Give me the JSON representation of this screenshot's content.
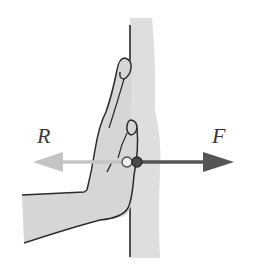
{
  "figure": {
    "labels": {
      "reaction": "R",
      "force": "F"
    },
    "colors": {
      "wall_fill": "#dcdcdc",
      "hand_fill": "#d4d4d4",
      "outline": "#2a2a2a",
      "reaction_arrow": "#c4c4c4",
      "force_arrow": "#555555",
      "background": "#ffffff"
    }
  }
}
